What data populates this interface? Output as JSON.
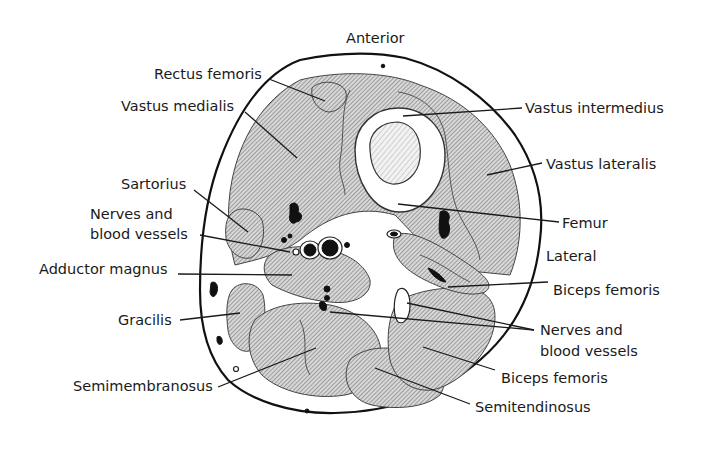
{
  "figure": {
    "colors": {
      "outline": "#111111",
      "hatch": "#6a6a6a",
      "background": "#ffffff",
      "text": "#1a1a1a"
    },
    "orientation": {
      "top": "Anterior",
      "right": "Lateral"
    },
    "labels": {
      "left": [
        {
          "id": "rectus-femoris",
          "text": "Rectus femoris"
        },
        {
          "id": "vastus-medialis",
          "text": "Vastus medialis"
        },
        {
          "id": "sartorius",
          "text": "Sartorius"
        },
        {
          "id": "nerves-vessels-left-1",
          "text": "Nerves and"
        },
        {
          "id": "nerves-vessels-left-2",
          "text": "blood vessels"
        },
        {
          "id": "adductor-magnus",
          "text": "Adductor magnus"
        },
        {
          "id": "gracilis",
          "text": "Gracilis"
        },
        {
          "id": "semimembranosus",
          "text": "Semimembranosus"
        }
      ],
      "right": [
        {
          "id": "vastus-intermedius",
          "text": "Vastus intermedius"
        },
        {
          "id": "vastus-lateralis",
          "text": "Vastus lateralis"
        },
        {
          "id": "femur",
          "text": "Femur"
        },
        {
          "id": "biceps-femoris-upper",
          "text": "Biceps femoris"
        },
        {
          "id": "nerves-vessels-right-1",
          "text": "Nerves and"
        },
        {
          "id": "nerves-vessels-right-2",
          "text": "blood vessels"
        },
        {
          "id": "biceps-femoris-lower",
          "text": "Biceps femoris"
        },
        {
          "id": "semitendinosus",
          "text": "Semitendinosus"
        }
      ]
    }
  }
}
